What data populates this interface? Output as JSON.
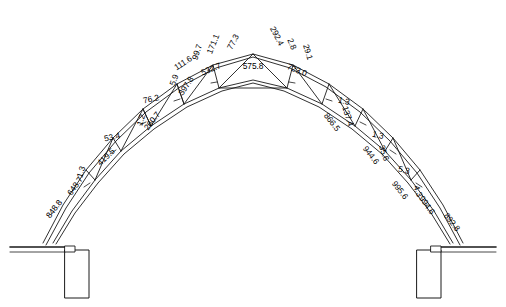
{
  "diagram": {
    "type": "structural-truss-elevation",
    "symmetry": "bilateral about vertical centerline",
    "stroke_color": "#1a1a1a",
    "background_color": "#ffffff",
    "supports": [
      {
        "name": "left-support-column",
        "side": "left"
      },
      {
        "name": "right-support-column",
        "side": "right"
      }
    ],
    "labels": [
      {
        "id": "l01",
        "text": "575.8",
        "x": 253,
        "y": 66,
        "rot": 0,
        "size": "big"
      },
      {
        "id": "l02",
        "text": "77.3",
        "x": 233,
        "y": 42,
        "rot": -62,
        "size": "big"
      },
      {
        "id": "l03",
        "text": "292.4",
        "x": 277,
        "y": 36,
        "rot": 63,
        "size": "big"
      },
      {
        "id": "l04",
        "text": "171.1",
        "x": 213,
        "y": 44,
        "rot": -68,
        "size": "big"
      },
      {
        "id": "l05",
        "text": "99.7",
        "x": 197,
        "y": 52,
        "rot": -72,
        "size": "big"
      },
      {
        "id": "l06",
        "text": "532.7",
        "x": 211,
        "y": 69,
        "rot": -22,
        "size": "big"
      },
      {
        "id": "l07",
        "text": "723.0",
        "x": 297,
        "y": 70,
        "rot": 22,
        "size": "big"
      },
      {
        "id": "l08",
        "text": "2.8",
        "x": 292,
        "y": 44,
        "rot": 68,
        "size": "big"
      },
      {
        "id": "l09",
        "text": "29.1",
        "x": 308,
        "y": 52,
        "rot": 73,
        "size": "big"
      },
      {
        "id": "l10",
        "text": "111.6",
        "x": 183,
        "y": 63,
        "rot": -33,
        "size": "big"
      },
      {
        "id": "l11",
        "text": "5.9",
        "x": 174,
        "y": 80,
        "rot": -70,
        "size": "big"
      },
      {
        "id": "l12",
        "text": "397.8",
        "x": 186,
        "y": 86,
        "rot": -57,
        "size": "big"
      },
      {
        "id": "l13",
        "text": "76.2",
        "x": 151,
        "y": 99,
        "rot": -12,
        "size": "big"
      },
      {
        "id": "l14",
        "text": "1.2",
        "x": 141,
        "y": 120,
        "rot": -72,
        "size": "big"
      },
      {
        "id": "l15",
        "text": "260.7",
        "x": 152,
        "y": 121,
        "rot": -52,
        "size": "big"
      },
      {
        "id": "l16",
        "text": "53.4",
        "x": 112,
        "y": 137,
        "rot": -12,
        "size": "big"
      },
      {
        "id": "l17",
        "text": "419.5",
        "x": 106,
        "y": 157,
        "rot": -44,
        "size": "big"
      },
      {
        "id": "l18",
        "text": "1.3",
        "x": 81,
        "y": 172,
        "rot": -72,
        "size": "big"
      },
      {
        "id": "l19",
        "text": "648.7",
        "x": 75,
        "y": 186,
        "rot": -55,
        "size": "big"
      },
      {
        "id": "l20",
        "text": "848.8",
        "x": 54,
        "y": 209,
        "rot": -52,
        "size": "big"
      },
      {
        "id": "l21",
        "text": "1.3",
        "x": 344,
        "y": 101,
        "rot": 12,
        "size": "big"
      },
      {
        "id": "l22",
        "text": "866.5",
        "x": 332,
        "y": 122,
        "rot": 52,
        "size": "big"
      },
      {
        "id": "l23",
        "text": "137.4",
        "x": 348,
        "y": 116,
        "rot": 72,
        "size": "big"
      },
      {
        "id": "l24",
        "text": "1.3",
        "x": 378,
        "y": 135,
        "rot": 12,
        "size": "big"
      },
      {
        "id": "l25",
        "text": "944.6",
        "x": 371,
        "y": 155,
        "rot": 52,
        "size": "big"
      },
      {
        "id": "l26",
        "text": "35.6",
        "x": 384,
        "y": 153,
        "rot": 72,
        "size": "big"
      },
      {
        "id": "l27",
        "text": "5.3",
        "x": 404,
        "y": 170,
        "rot": 12,
        "size": "big"
      },
      {
        "id": "l28",
        "text": "995.6",
        "x": 400,
        "y": 190,
        "rot": 52,
        "size": "big"
      },
      {
        "id": "l29",
        "text": "4.3",
        "x": 418,
        "y": 191,
        "rot": 72,
        "size": "big"
      },
      {
        "id": "l30",
        "text": "994.6",
        "x": 427,
        "y": 205,
        "rot": 55,
        "size": "big"
      },
      {
        "id": "l31",
        "text": "892.8",
        "x": 452,
        "y": 222,
        "rot": 52,
        "size": "big"
      }
    ]
  }
}
